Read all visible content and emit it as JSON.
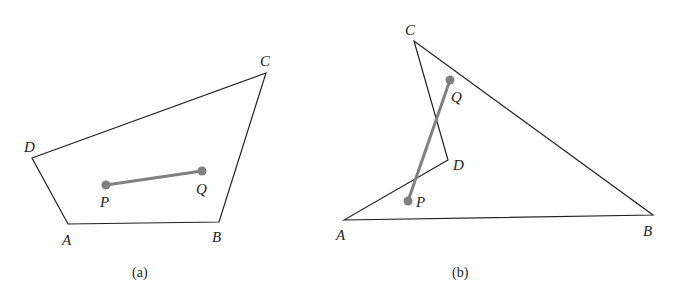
{
  "figures": [
    {
      "caption": "(a)",
      "vertices": {
        "A": "A",
        "B": "B",
        "C": "C",
        "D": "D"
      },
      "points": {
        "P": "P",
        "Q": "Q"
      }
    },
    {
      "caption": "(b)",
      "vertices": {
        "A": "A",
        "B": "B",
        "C": "C",
        "D": "D"
      },
      "points": {
        "P": "P",
        "Q": "Q"
      }
    }
  ],
  "colors": {
    "outline": "#222222",
    "segment": "#808080",
    "point": "#808080"
  }
}
